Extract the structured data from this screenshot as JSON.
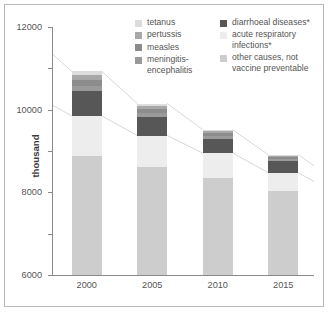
{
  "chart_data": {
    "type": "bar",
    "subtype": "stacked-bar",
    "title": "",
    "xlabel": "",
    "ylabel": "thousand",
    "categories": [
      "2000",
      "2005",
      "2010",
      "2015"
    ],
    "ylim": [
      0,
      12000
    ],
    "yticks": [
      0,
      2000,
      4000,
      6000,
      8000,
      10000,
      12000
    ],
    "ytick_labels": [
      "0",
      "2000",
      "4000",
      "6000",
      "8000",
      "10000",
      "12000"
    ],
    "grid": false,
    "legend_position": "top-right",
    "stack_order_bottom_to_top": [
      "other causes, not vaccine preventable",
      "acute respiratory infections*",
      "diarrhoeal diseases*",
      "meningitis-encephalitis",
      "measles",
      "pertussis",
      "tetanus"
    ],
    "series": [
      {
        "name": "other causes, not vaccine preventable",
        "color": "#cdcdcd",
        "values": [
          5750,
          5250,
          4700,
          4050
        ]
      },
      {
        "name": "acute respiratory infections*",
        "color": "#ededed",
        "values": [
          1950,
          1500,
          1200,
          900
        ]
      },
      {
        "name": "diarrhoeal diseases*",
        "color": "#575757",
        "values": [
          1200,
          900,
          700,
          550
        ]
      },
      {
        "name": "meningitis-encephalitis",
        "color": "#9a9a9a",
        "values": [
          250,
          200,
          150,
          120
        ]
      },
      {
        "name": "measles",
        "color": "#8c8c8c",
        "values": [
          300,
          180,
          100,
          70
        ]
      },
      {
        "name": "pertussis",
        "color": "#a8a8a8",
        "values": [
          230,
          170,
          120,
          90
        ]
      },
      {
        "name": "tetanus",
        "color": "#dcdcdc",
        "values": [
          170,
          100,
          60,
          40
        ]
      }
    ],
    "totals": [
      9850,
      8300,
      7030,
      5820
    ]
  },
  "legend": {
    "left_column": [
      {
        "label": "tetanus",
        "color": "#dcdcdc"
      },
      {
        "label": "pertussis",
        "color": "#a8a8a8"
      },
      {
        "label": "measles",
        "color": "#8c8c8c"
      },
      {
        "label": "meningitis-\nencephalitis",
        "color": "#9a9a9a"
      }
    ],
    "right_column": [
      {
        "label": "diarrhoeal diseases*",
        "color": "#575757"
      },
      {
        "label": "acute respiratory\ninfections*",
        "color": "#ededed"
      },
      {
        "label": "other causes, not\nvaccine preventable",
        "color": "#cdcdcd"
      }
    ]
  },
  "axes": {
    "y_label": "thousand",
    "y_ticks": [
      "12000",
      "10000",
      "8000",
      "6000",
      "4000",
      "2000",
      "0"
    ],
    "x_ticks": [
      "2000",
      "2005",
      "2010",
      "2015"
    ]
  },
  "colors": {
    "frame": "#b9b9b9",
    "axis": "#8a8a8a",
    "text": "#555555",
    "connector": "#d8d8d8"
  }
}
